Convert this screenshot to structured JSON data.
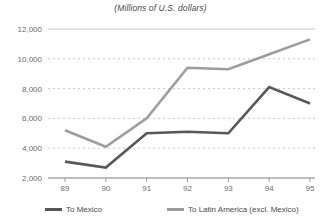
{
  "chart_data": {
    "type": "line",
    "title": "(Millions of U.S. dollars)",
    "xlabel": "",
    "ylabel": "",
    "categories": [
      "89",
      "90",
      "91",
      "92",
      "93",
      "94",
      "95"
    ],
    "ylim": [
      2000,
      12000
    ],
    "yticks": [
      "2,000",
      "4,000",
      "6,000",
      "8,000",
      "10,000",
      "12,000"
    ],
    "ytick_values": [
      2000,
      4000,
      6000,
      8000,
      10000,
      12000
    ],
    "grid": "horizontal-dashed",
    "legend_position": "bottom",
    "series": [
      {
        "name": "To Mexico",
        "color": "#58585a",
        "values": [
          3100,
          2700,
          5000,
          5100,
          5000,
          8100,
          7000
        ]
      },
      {
        "name": "To Latin America (excl. Mexico)",
        "color": "#9d9d9f",
        "values": [
          5200,
          4100,
          6000,
          9400,
          9300,
          10300,
          11300
        ]
      }
    ]
  },
  "legend": {
    "items": [
      {
        "label": "To Mexico",
        "color": "#58585a"
      },
      {
        "label": "To Latin America (excl. Mexico)",
        "color": "#9d9d9f"
      }
    ]
  },
  "colors": {
    "mexico": "#58585a",
    "latin_america": "#9d9d9f",
    "grid": "#c9c9c9",
    "axis": "#9a9a9a",
    "text": "#5e5e5e"
  }
}
